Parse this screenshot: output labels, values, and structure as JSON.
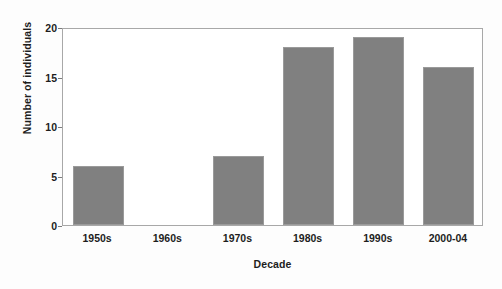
{
  "chart_data": {
    "type": "bar",
    "title": "",
    "xlabel": "Decade",
    "ylabel": "Number of individuals",
    "categories": [
      "1950s",
      "1960s",
      "1970s",
      "1980s",
      "1990s",
      "2000-04"
    ],
    "values": [
      6,
      0,
      7,
      18,
      19,
      16
    ],
    "ylim": [
      0,
      20
    ],
    "yticks": [
      0,
      5,
      10,
      15,
      20
    ],
    "ytick_labels": [
      "0",
      "5",
      "10",
      "15",
      "20"
    ],
    "grid": false,
    "legend": null,
    "bar_color": "#808080",
    "frame_color": "#a8a8a8",
    "text_color": "#1d1d1d",
    "background": "#ffffff"
  }
}
